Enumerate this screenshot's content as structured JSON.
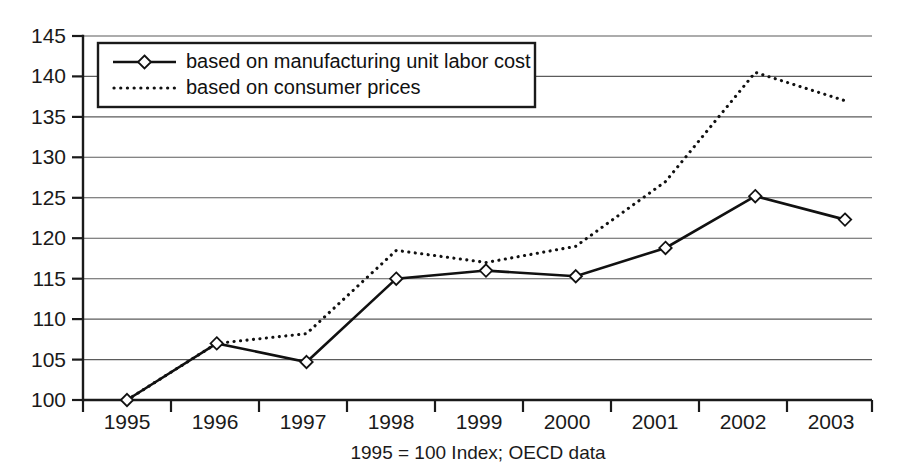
{
  "chart_data": {
    "type": "line",
    "title": "",
    "subtitle": "",
    "caption": "1995 = 100 Index; OECD data",
    "xlabel": "",
    "ylabel": "",
    "categories": [
      "1995",
      "1996",
      "1997",
      "1998",
      "1999",
      "2000",
      "2001",
      "2002",
      "2003"
    ],
    "x": [
      1995,
      1996,
      1997,
      1998,
      1999,
      2000,
      2001,
      2002,
      2003
    ],
    "series": [
      {
        "name": "based on manufacturing unit labor cost",
        "style": "solid-with-diamond-markers",
        "values": [
          100,
          107,
          104.7,
          115,
          116,
          115.3,
          118.8,
          125.2,
          122.3
        ]
      },
      {
        "name": "based on consumer prices",
        "style": "dotted",
        "values": [
          100,
          107,
          108.2,
          118.5,
          117,
          119,
          127,
          140.5,
          137
        ]
      }
    ],
    "ylim": [
      100,
      145
    ],
    "xlim": [
      1995,
      2003
    ],
    "ytick_labels": [
      "145",
      "140",
      "135",
      "130",
      "125",
      "120",
      "115",
      "110",
      "105",
      "100"
    ],
    "ytick_values": [
      145,
      140,
      135,
      130,
      125,
      120,
      115,
      110,
      105,
      100
    ],
    "ytick_step": 5,
    "grid": true,
    "grid_axis": "y",
    "legend_position": "top-left-inside",
    "colors": {
      "line": "#111111",
      "grid": "#5b5b5b",
      "axis": "#1a1a1a",
      "background": "#ffffff",
      "marker_fill": "#ffffff"
    }
  },
  "legend": {
    "entries": [
      {
        "label": "based on manufacturing unit labor cost",
        "marker": "line-diamond-marker"
      },
      {
        "label": "based on consumer prices",
        "marker": "dotted-line-marker"
      }
    ]
  },
  "axes": {
    "y_ticks": [
      "145",
      "140",
      "135",
      "130",
      "125",
      "120",
      "115",
      "110",
      "105",
      "100"
    ],
    "x_ticks": [
      "1995",
      "1996",
      "1997",
      "1998",
      "1999",
      "2000",
      "2001",
      "2002",
      "2003"
    ],
    "caption": "1995 = 100 Index; OECD data"
  }
}
